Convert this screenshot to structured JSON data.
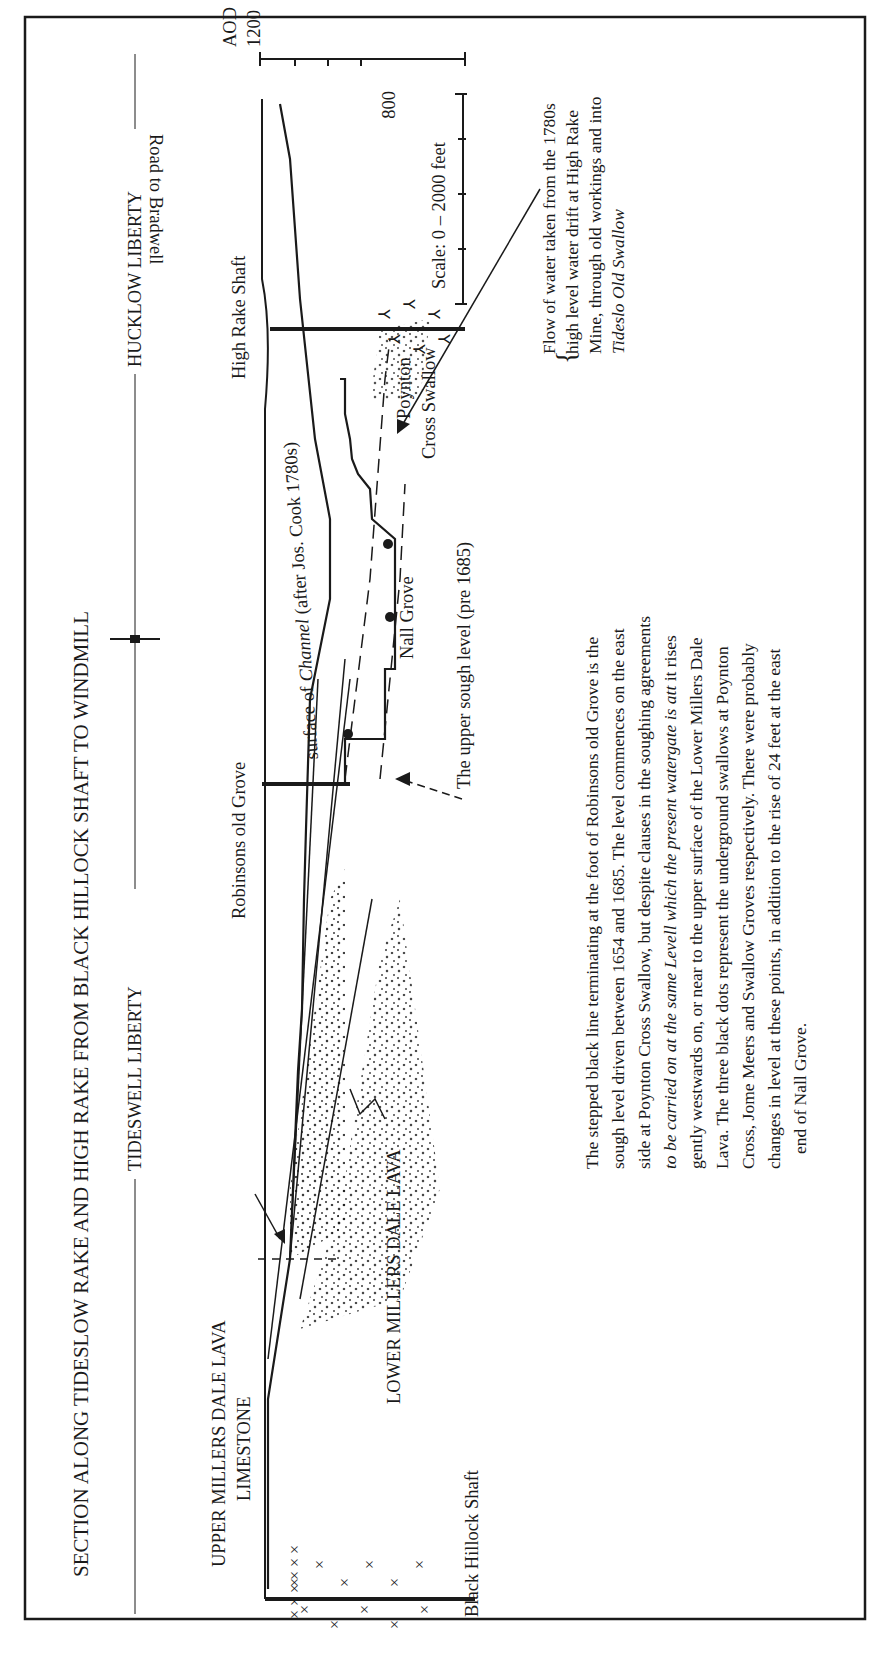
{
  "diagram": {
    "title": "SECTION ALONG TIDESLOW RAKE AND HIGH RAKE FROM BLACK HILLOCK SHAFT TO WINDMILL",
    "orientation": "rotated 90° counter-clockwise",
    "liberties": {
      "west": "TIDESWELL LIBERTY",
      "east": "HUCKLOW LIBERTY"
    },
    "elevation_axis": {
      "datum": "AOD",
      "ticks": [
        "1200",
        "800"
      ],
      "units": "feet"
    },
    "scale": {
      "label": "Scale:  0 – 2000 feet",
      "min": "0",
      "max": "2000",
      "units": "feet"
    },
    "shafts": [
      {
        "name": "Black Hillock Shaft"
      },
      {
        "name": "Robinsons old Grove"
      },
      {
        "name": "High Rake Shaft"
      }
    ],
    "surface_labels": {
      "road": "Road to Bradwell"
    },
    "strata": {
      "upper_lava": "UPPER MILLERS DALE LAVA",
      "limestone": "LIMESTONE",
      "lower_lava": "LOWER MILLERS DALE LAVA"
    },
    "features": {
      "channel_prefix": "surface of ",
      "channel_word": "Channel",
      "channel_suffix": " (after Jos. Cook 1780s)",
      "nall_grove": "Nall Grove",
      "poynton_1": "Poynton",
      "poynton_2": "Cross Swallow",
      "upper_sough": "The upper sough level (pre 1685)"
    },
    "flow_note": {
      "line1": "Flow of water taken from the 1780s",
      "line2": "high level water drift at High Rake",
      "line3": "Mine, through old workings and into",
      "line4": "Tideslo Old Swallow"
    },
    "caption": {
      "line1": "The stepped black line terminating at the foot of Robinsons old Grove is the",
      "line2": "sough level driven between 1654 and 1685. The level commences on the east",
      "line3": "side at Poynton Cross Swallow, but despite clauses in the soughing agreements",
      "line4_italic": "to be carried on at the same Levell which the present watergate is att",
      "line4_rest": " it rises",
      "line5": "gently westwards on, or near to the upper surface of the Lower Millers Dale",
      "line6": "Lava. The three black dots represent the underground swallows at Poynton",
      "line7": "Cross, Jome Meers and Swallow Groves respectively. There were probably",
      "line8": "changes in level at these points, in addition to the rise of 24 feet at the east",
      "line9": "end of Nall Grove."
    }
  }
}
